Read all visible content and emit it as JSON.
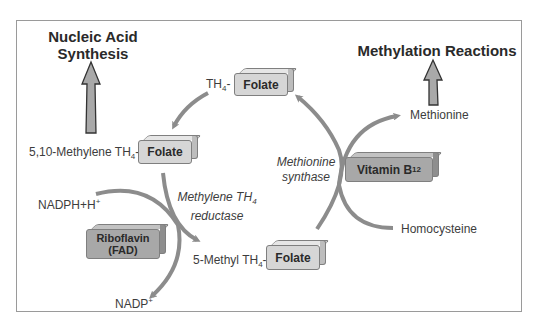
{
  "titles": {
    "nucleic_acid": "Nucleic Acid Synthesis",
    "nucleic_acid_line1": "Nucleic Acid",
    "nucleic_acid_line2": "Synthesis",
    "methylation": "Methylation Reactions"
  },
  "boxes": {
    "folate_top": "Folate",
    "folate_left": "Folate",
    "folate_bottom": "Folate",
    "vitamin_b12": "Vitamin B",
    "vitamin_b12_sub": "12",
    "riboflavin_line1": "Riboflavin",
    "riboflavin_line2": "(FAD)"
  },
  "labels": {
    "th4": "TH",
    "th4_sub": "4",
    "th4_suffix": "-",
    "methylene_th4": "5,10-Methylene TH",
    "methylene_th4_sub": "4",
    "methylene_th4_suffix": "-",
    "methyl_th4": "5-Methyl TH",
    "methyl_th4_sub": "4",
    "methyl_th4_suffix": "-",
    "nadph": "NADPH+H",
    "nadph_sup": "+",
    "nadp": "NADP",
    "nadp_sup": "+",
    "methionine": "Methionine",
    "homocysteine": "Homocysteine"
  },
  "enzymes": {
    "mthfr_line1": "Methylene TH",
    "mthfr_line1_sub": "4",
    "mthfr_line2": "reductase",
    "ms_line1": "Methionine",
    "ms_line2": "synthase"
  },
  "colors": {
    "arrow": "#8c8c8c",
    "box_light": "#d6d6d6",
    "box_dark": "#a8a8a8",
    "border": "#9a9a9a"
  }
}
